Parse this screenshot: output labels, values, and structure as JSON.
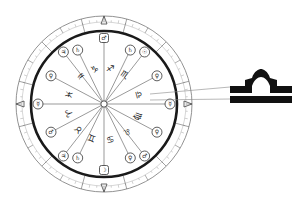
{
  "diagram": {
    "type": "zodiac-wheel",
    "center": {
      "x": 104,
      "y": 104
    },
    "colors": {
      "ink": "#1a1a1a",
      "line": "#555555",
      "ring": "#777777",
      "background": "#ffffff"
    },
    "signs": [
      {
        "name": "aries",
        "glyph": "♈",
        "angle": 195
      },
      {
        "name": "taurus",
        "glyph": "♉",
        "angle": 225
      },
      {
        "name": "gemini",
        "glyph": "♊",
        "angle": 250
      },
      {
        "name": "cancer",
        "glyph": "♋",
        "angle": 280
      },
      {
        "name": "leo",
        "glyph": "♌",
        "angle": 310
      },
      {
        "name": "virgo",
        "glyph": "♍",
        "angle": 340
      },
      {
        "name": "libra",
        "glyph": "♎",
        "angle": 15
      },
      {
        "name": "scorpio",
        "glyph": "♏",
        "angle": 55
      },
      {
        "name": "sagittarius",
        "glyph": "♐",
        "angle": 80
      },
      {
        "name": "capricorn",
        "glyph": "♑",
        "angle": 105
      },
      {
        "name": "aquarius",
        "glyph": "♒",
        "angle": 130
      },
      {
        "name": "pisces",
        "glyph": "♓",
        "angle": 165
      }
    ],
    "cusp_markers": [
      {
        "angle": 0,
        "glyph": "☿",
        "shape": "circle"
      },
      {
        "angle": 28,
        "glyph": "♀",
        "shape": "circle"
      },
      {
        "angle": 52,
        "glyph": "☉",
        "shape": "circle"
      },
      {
        "angle": 64,
        "glyph": "♄",
        "shape": "circle"
      },
      {
        "angle": 90,
        "glyph": "♂",
        "shape": "box"
      },
      {
        "angle": 116,
        "glyph": "♄",
        "shape": "circle"
      },
      {
        "angle": 128,
        "glyph": "♃",
        "shape": "circle"
      },
      {
        "angle": 152,
        "glyph": "♀",
        "shape": "circle"
      },
      {
        "angle": 180,
        "glyph": "☿",
        "shape": "circle"
      },
      {
        "angle": 208,
        "glyph": "♂",
        "shape": "circle"
      },
      {
        "angle": 232,
        "glyph": "♃",
        "shape": "circle"
      },
      {
        "angle": 244,
        "glyph": "♄",
        "shape": "circle"
      },
      {
        "angle": 270,
        "glyph": "☽",
        "shape": "box"
      },
      {
        "angle": 296,
        "glyph": "♀",
        "shape": "circle"
      },
      {
        "angle": 308,
        "glyph": "♂",
        "shape": "circle"
      },
      {
        "angle": 332,
        "glyph": "♀",
        "shape": "circle"
      }
    ],
    "callout": {
      "label": "libra-symbol",
      "glyph": "♎"
    }
  }
}
